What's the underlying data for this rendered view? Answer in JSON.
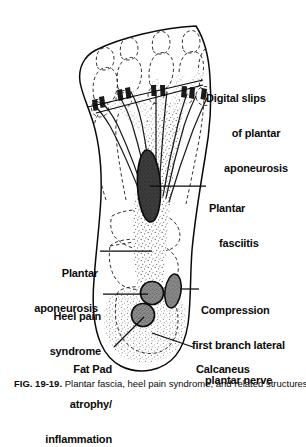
{
  "figure": {
    "kind": "anatomical-illustration",
    "view": "plantar (sole) view of right foot, toes toward upper right"
  },
  "labels": [
    {
      "id": "digital-slips",
      "name": "label-digital-slips-of-plantar-aponeurosis",
      "lines": [
        "Digital slips",
        "of plantar",
        "aponeurosis"
      ],
      "align": "left",
      "x": 205,
      "y": 72,
      "leader": {
        "x1": 203,
        "y1": 80,
        "x2": 88,
        "y2": 107
      }
    },
    {
      "id": "plantar-fasciitis",
      "name": "label-plantar-fasciitis",
      "lines": [
        "Plantar",
        "fasciitis"
      ],
      "align": "left",
      "x": 208,
      "y": 178,
      "leader": {
        "x1": 206,
        "y1": 186,
        "x2": 149,
        "y2": 186
      }
    },
    {
      "id": "plantar-aponeurosis",
      "name": "label-plantar-aponeurosis",
      "lines": [
        "Plantar",
        "aponeurosis"
      ],
      "align": "right",
      "x": 98,
      "y": 244,
      "leader": {
        "x1": 100,
        "y1": 251,
        "x2": 150,
        "y2": 251
      }
    },
    {
      "id": "heel-pain-syndrome",
      "name": "label-heel-pain-syndrome",
      "lines": [
        "Heel pain",
        "syndrome"
      ],
      "align": "right",
      "x": 101,
      "y": 287,
      "leader": {
        "x1": 103,
        "y1": 294,
        "x2": 148,
        "y2": 294
      }
    },
    {
      "id": "compression-nerve",
      "name": "label-compression-first-branch-lateral-plantar-nerve",
      "lines": [
        "Compression",
        "first branch lateral",
        "plantar nerve"
      ],
      "align": "left",
      "x": 201,
      "y": 282,
      "leader": {
        "x1": 199,
        "y1": 289,
        "x2": 179,
        "y2": 289
      }
    },
    {
      "id": "calcaneus",
      "name": "label-calcaneus",
      "lines": [
        "Calcaneus"
      ],
      "align": "left",
      "x": 195,
      "y": 341,
      "leader": {
        "x1": 193,
        "y1": 347,
        "x2": 155,
        "y2": 334
      }
    },
    {
      "id": "fat-pad",
      "name": "label-fat-pad-atrophy-inflammation",
      "lines": [
        "Fat Pad",
        "atrophy/",
        "inflammation"
      ],
      "align": "right",
      "x": 112,
      "y": 341,
      "leader": {
        "x1": 114,
        "y1": 347,
        "x2": 147,
        "y2": 316
      }
    }
  ],
  "markers": {
    "plantar_fasciitis_focus": {
      "name": "plantar-fasciitis-focus",
      "shape": "ellipse",
      "color": "#3c3c3c"
    },
    "heel_pain_circle": {
      "name": "heel-pain-syndrome-marker",
      "shape": "circle",
      "color": "#8d8d8d"
    },
    "fat_pad_circle": {
      "name": "fat-pad-marker",
      "shape": "circle",
      "color": "#8d8d8d"
    },
    "nerve_oval": {
      "name": "lateral-plantar-nerve-marker",
      "shape": "ellipse",
      "color": "#8d8d8d"
    }
  },
  "colors": {
    "ink": "#0a0a0a",
    "bone_dash": "#2a2a2a",
    "aponeurosis_stipple": "#b9b9b9",
    "fasciitis_dark": "#3c3c3c",
    "marker_gray": "#8d8d8d",
    "background": "#ffffff"
  },
  "caption": {
    "number": "FIG. 19-19.",
    "text": "Plantar fascia, heel pain syndrome, and related structures."
  }
}
